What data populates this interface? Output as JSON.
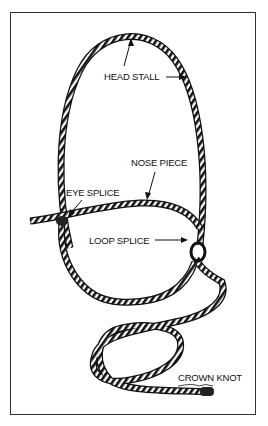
{
  "diagram": {
    "labels": {
      "head_stall": "HEAD STALL",
      "nose_piece": "NOSE PIECE",
      "eye_splice": "EYE SPLICE",
      "loop_splice": "LOOP SPLICE",
      "crown_knot": "CROWN KNOT"
    },
    "colors": {
      "ink": "#111111",
      "border": "#333333",
      "background": "#ffffff"
    }
  }
}
